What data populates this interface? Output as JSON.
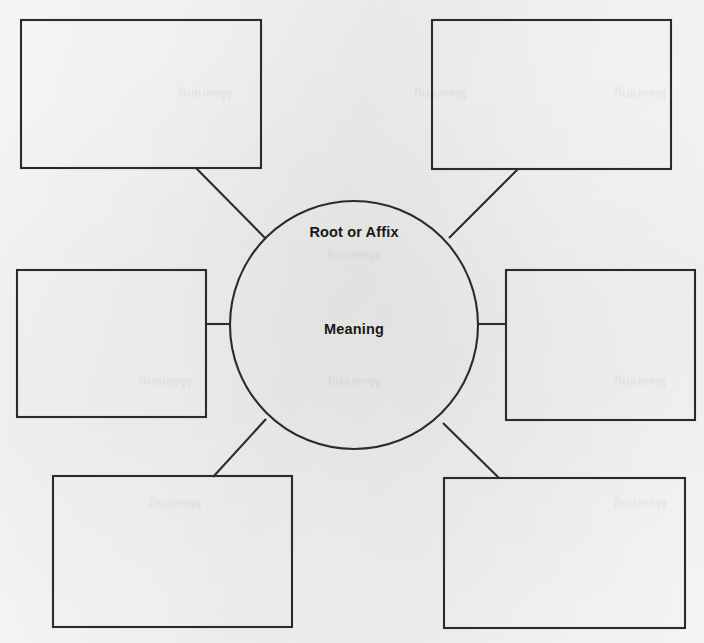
{
  "page": {
    "background_color": "#f5f5f3",
    "ink_color": "#2b2b2b",
    "width": 704,
    "height": 643
  },
  "center_node": {
    "name": "center-circle",
    "shape": "circle",
    "cx": 354,
    "cy": 325,
    "r": 124,
    "top_label": "Root or Affix",
    "bottom_label": "Meaning"
  },
  "boxes": [
    {
      "id": "box-top-left",
      "label": "",
      "x": 21,
      "y": 20,
      "width": 240,
      "height": 148
    },
    {
      "id": "box-top-right",
      "label": "",
      "x": 432,
      "y": 20,
      "width": 239,
      "height": 149
    },
    {
      "id": "box-middle-left",
      "label": "",
      "x": 17,
      "y": 270,
      "width": 189,
      "height": 147
    },
    {
      "id": "box-middle-right",
      "label": "",
      "x": 506,
      "y": 270,
      "width": 189,
      "height": 150
    },
    {
      "id": "box-bottom-left",
      "label": "",
      "x": 53,
      "y": 476,
      "width": 239,
      "height": 151
    },
    {
      "id": "box-bottom-right",
      "label": "",
      "x": 444,
      "y": 478,
      "width": 241,
      "height": 150
    }
  ],
  "connectors": [
    {
      "id": "connector-top-left",
      "from": "box-top-left",
      "x1": 196,
      "y1": 168,
      "x2": 266,
      "y2": 239
    },
    {
      "id": "connector-top-right",
      "from": "box-top-right",
      "x1": 518,
      "y1": 169,
      "x2": 449,
      "y2": 238
    },
    {
      "id": "connector-middle-left",
      "from": "box-middle-left",
      "x1": 206,
      "y1": 324,
      "x2": 231,
      "y2": 324
    },
    {
      "id": "connector-middle-right",
      "from": "box-middle-right",
      "x1": 477,
      "y1": 324,
      "x2": 506,
      "y2": 324
    },
    {
      "id": "connector-bottom-left",
      "from": "box-bottom-left",
      "x1": 266,
      "y1": 419,
      "x2": 213,
      "y2": 477
    },
    {
      "id": "connector-bottom-right",
      "from": "box-bottom-right",
      "x1": 443,
      "y1": 423,
      "x2": 499,
      "y2": 478
    }
  ],
  "watermarks": [
    {
      "text": "Meaning",
      "x": 354,
      "y": 262
    },
    {
      "text": "Meaning",
      "x": 354,
      "y": 388
    },
    {
      "text": "Meaning",
      "x": 205,
      "y": 100
    },
    {
      "text": "Meaning",
      "x": 440,
      "y": 100
    },
    {
      "text": "Meaning",
      "x": 640,
      "y": 100
    },
    {
      "text": "Meaning",
      "x": 165,
      "y": 388
    },
    {
      "text": "Meaning",
      "x": 640,
      "y": 388
    },
    {
      "text": "Meaning",
      "x": 175,
      "y": 510
    },
    {
      "text": "Meaning",
      "x": 640,
      "y": 510
    }
  ]
}
